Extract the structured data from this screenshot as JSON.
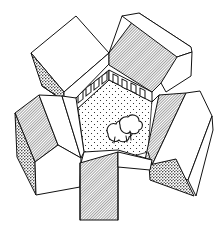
{
  "figure": {
    "title": "Courtyard enclosed by five building blocks",
    "colors": {
      "line": "#111111",
      "background": "#ffffff",
      "hatch": "#111111"
    },
    "buildings": [
      {
        "id": "north-west",
        "label": "Building block NW"
      },
      {
        "id": "north-east",
        "label": "Building block NE"
      },
      {
        "id": "west",
        "label": "Building block W"
      },
      {
        "id": "east",
        "label": "Building block E"
      },
      {
        "id": "south",
        "label": "Building block S"
      }
    ],
    "courtyard": {
      "label": "Central courtyard",
      "trees": 2,
      "facade_windows": 8
    }
  }
}
